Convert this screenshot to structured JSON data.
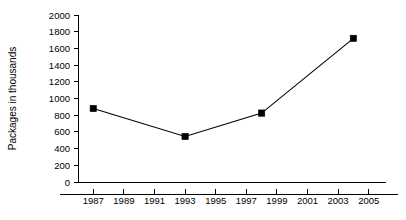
{
  "chart_data": {
    "type": "line",
    "title": "",
    "subtitle": "",
    "xlabel": "",
    "ylabel": "Packages in thousands",
    "xlim": [
      1986,
      2006
    ],
    "ylim": [
      0,
      2000
    ],
    "grid": false,
    "legend": false,
    "legend_position": "none",
    "x_ticks": [
      1987,
      1989,
      1991,
      1993,
      1995,
      1997,
      1999,
      2001,
      2003,
      2005
    ],
    "x_tick_labels": [
      "1987",
      "1989",
      "1991",
      "1993",
      "1995",
      "1997",
      "1999",
      "2001",
      "2003",
      "2005"
    ],
    "y_ticks": [
      0,
      200,
      400,
      600,
      800,
      1000,
      1200,
      1400,
      1600,
      1800,
      2000
    ],
    "y_tick_labels": [
      "0",
      "200",
      "400",
      "600",
      "800",
      "1000",
      "1200",
      "1400",
      "1600",
      "1800",
      "2000"
    ],
    "marker": "square",
    "marker_color": "#000000",
    "line_color": "#000000",
    "series": [
      {
        "name": "Packages",
        "x": [
          1987,
          1993,
          1998,
          2004
        ],
        "values": [
          880,
          545,
          825,
          1720
        ]
      }
    ],
    "points": [
      {
        "x": 1987,
        "y": 880
      },
      {
        "x": 1993,
        "y": 545
      },
      {
        "x": 1998,
        "y": 825
      },
      {
        "x": 2004,
        "y": 1720
      }
    ]
  }
}
